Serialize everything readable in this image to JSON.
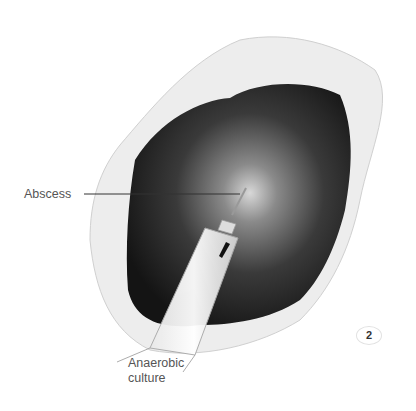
{
  "figure": {
    "labels": {
      "abscess": "Abscess",
      "culture_line1": "Anaerobic",
      "culture_line2": "culture"
    },
    "figure_number": "2",
    "signature": "G/S"
  }
}
